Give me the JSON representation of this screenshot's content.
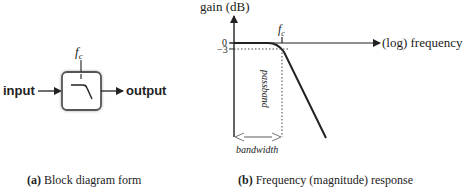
{
  "panel_a": {
    "input_label": "input",
    "output_label": "output",
    "cutoff_label_f": "f",
    "cutoff_label_sub": "c",
    "caption_tag": "(a)",
    "caption_text": " Block diagram form"
  },
  "panel_b": {
    "y_axis_label": "gain (dB)",
    "x_axis_label": "(log) frequency",
    "tick_0": "0",
    "tick_minus3": "−3",
    "cutoff_label_f": "f",
    "cutoff_label_sub": "c",
    "passband_label": "passband",
    "bandwidth_label": "bandwidth",
    "caption_tag": "(b)",
    "caption_text": " Frequency (magnitude) response"
  },
  "colors": {
    "stroke": "#222222",
    "box_border": "#555555",
    "dotted": "#444444",
    "bandwidth_arrow": "#777777"
  }
}
